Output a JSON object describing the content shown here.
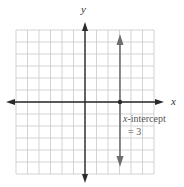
{
  "diagram": {
    "type": "coordinate-plane",
    "x_axis_label": "x",
    "y_axis_label": "y",
    "grid": {
      "columns": 12,
      "rows": 12,
      "x_range": [
        -6,
        6
      ],
      "y_range": [
        -6,
        6
      ]
    },
    "line": {
      "equation": "x = 3",
      "orientation": "vertical",
      "x": 3,
      "color": "#6e6e6e"
    },
    "point": {
      "x": 3,
      "y": 0
    },
    "annotation": {
      "line1_italic": "x",
      "line1_rest": "-intercept",
      "line2": "= 3"
    },
    "colors": {
      "grid": "#c8c8c8",
      "axis": "#2a2a2a",
      "line": "#6e6e6e",
      "text": "#555555"
    }
  }
}
